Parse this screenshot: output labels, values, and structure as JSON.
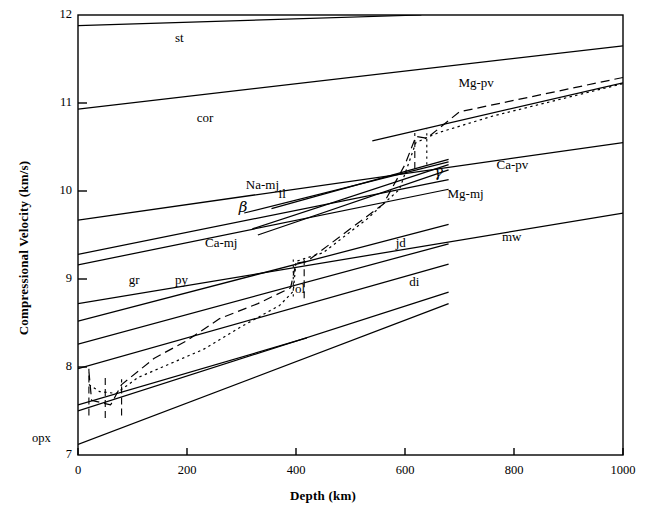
{
  "figure": {
    "kind": "scientific-line-plot",
    "background": "#ffffff",
    "line_color": "#000000"
  },
  "axes": {
    "x_title": "Depth (km)",
    "y_title": "Compressional Velocity (km/s)",
    "x_ticks": [
      "0",
      "200",
      "400",
      "600",
      "800",
      "1000"
    ],
    "y_ticks": [
      "7",
      "8",
      "9",
      "10",
      "11",
      "12"
    ],
    "extra_y_label": "opx"
  },
  "chart_data": {
    "type": "line",
    "title": "",
    "xlabel": "Depth (km)",
    "ylabel": "Compressional Velocity (km/s)",
    "xlim": [
      0,
      1000
    ],
    "ylim": [
      7,
      12
    ],
    "xticks": [
      0,
      200,
      400,
      600,
      800,
      1000
    ],
    "yticks": [
      7,
      8,
      9,
      10,
      11,
      12
    ],
    "grid": false,
    "legend": "inline-curve-labels",
    "x_units": "km",
    "y_units": "km/s",
    "series": [
      {
        "name": "st",
        "label": "st",
        "style": "solid",
        "points": [
          [
            0,
            11.88
          ],
          [
            630,
            12.0
          ]
        ],
        "label_pos": [
          200,
          11.73
        ]
      },
      {
        "name": "cor",
        "label": "cor",
        "style": "solid",
        "points": [
          [
            0,
            10.93
          ],
          [
            1000,
            11.65
          ]
        ],
        "label_pos": [
          240,
          10.82
        ]
      },
      {
        "name": "Mg-pv",
        "label": "Mg-pv",
        "style": "solid",
        "points": [
          [
            540,
            10.57
          ],
          [
            1000,
            11.23
          ]
        ],
        "label_pos": [
          720,
          11.22
        ]
      },
      {
        "name": "Ca-pv",
        "label": "Ca-pv",
        "style": "solid",
        "points": [
          [
            0,
            9.67
          ],
          [
            1000,
            10.55
          ]
        ],
        "label_pos": [
          790,
          10.28
        ]
      },
      {
        "name": "mw",
        "label": "mw",
        "style": "solid",
        "points": [
          [
            0,
            8.72
          ],
          [
            1000,
            9.75
          ]
        ],
        "label_pos": [
          800,
          9.47
        ]
      },
      {
        "name": "Na-mj",
        "label": "Na-mj",
        "style": "solid",
        "points": [
          [
            305,
            9.75
          ],
          [
            680,
            10.33
          ]
        ],
        "label_pos": [
          330,
          10.06
        ]
      },
      {
        "name": "il",
        "label": "il",
        "style": "solid",
        "points": [
          [
            355,
            9.8
          ],
          [
            680,
            10.36
          ]
        ],
        "label_pos": [
          390,
          9.96
        ]
      },
      {
        "name": "beta",
        "label": "β",
        "style": "solid",
        "points": [
          [
            320,
            9.57
          ],
          [
            680,
            10.3
          ]
        ],
        "label_pos": [
          317,
          9.82
        ]
      },
      {
        "name": "gamma",
        "label": "γ",
        "style": "solid",
        "points": [
          [
            330,
            9.5
          ],
          [
            680,
            10.24
          ]
        ],
        "label_pos": [
          675,
          10.22
        ]
      },
      {
        "name": "Ca-mj",
        "label": "Ca-mj",
        "style": "solid",
        "points": [
          [
            0,
            9.28
          ],
          [
            680,
            10.13
          ]
        ],
        "label_pos": [
          255,
          9.4
        ]
      },
      {
        "name": "Mg-mj",
        "label": "Mg-mj",
        "style": "solid",
        "points": [
          [
            0,
            9.16
          ],
          [
            680,
            10.02
          ]
        ],
        "label_pos": [
          700,
          9.95
        ]
      },
      {
        "name": "gr",
        "label": "gr",
        "style": "solid",
        "points": [
          [
            0,
            8.52
          ],
          [
            680,
            9.62
          ]
        ],
        "label_pos": [
          115,
          8.98
        ]
      },
      {
        "name": "py",
        "label": "py",
        "style": "solid",
        "points": [
          [
            0,
            8.26
          ],
          [
            680,
            9.4
          ]
        ],
        "label_pos": [
          200,
          8.98
        ]
      },
      {
        "name": "jd",
        "label": "jd",
        "style": "solid",
        "points": [
          [
            0,
            7.98
          ],
          [
            680,
            9.17
          ]
        ],
        "label_pos": [
          605,
          9.4
        ]
      },
      {
        "name": "ol",
        "label": "ol",
        "style": "solid",
        "points": [
          [
            0,
            7.57
          ],
          [
            420,
            8.33
          ]
        ],
        "label_pos": [
          420,
          8.87
        ]
      },
      {
        "name": "di",
        "label": "di",
        "style": "solid",
        "points": [
          [
            0,
            7.5
          ],
          [
            680,
            8.85
          ]
        ],
        "label_pos": [
          630,
          8.95
        ]
      },
      {
        "name": "opx",
        "label": "opx",
        "style": "solid",
        "points": [
          [
            0,
            7.12
          ],
          [
            680,
            8.72
          ]
        ],
        "label_pos": [
          -40,
          7.18
        ]
      },
      {
        "name": "model-dashed",
        "label": "",
        "style": "dashed",
        "points": [
          [
            20,
            7.95
          ],
          [
            25,
            7.62
          ],
          [
            60,
            7.57
          ],
          [
            80,
            7.8
          ],
          [
            140,
            8.1
          ],
          [
            200,
            8.3
          ],
          [
            260,
            8.55
          ],
          [
            330,
            8.72
          ],
          [
            390,
            8.9
          ],
          [
            400,
            9.18
          ],
          [
            420,
            9.2
          ],
          [
            560,
            9.85
          ],
          [
            600,
            10.3
          ],
          [
            620,
            10.62
          ],
          [
            640,
            10.6
          ],
          [
            700,
            10.9
          ],
          [
            1000,
            11.29
          ]
        ]
      },
      {
        "name": "model-dotted",
        "label": "",
        "style": "dotted",
        "points": [
          [
            20,
            7.8
          ],
          [
            40,
            7.72
          ],
          [
            70,
            7.7
          ],
          [
            110,
            7.88
          ],
          [
            170,
            8.04
          ],
          [
            230,
            8.2
          ],
          [
            300,
            8.46
          ],
          [
            370,
            8.7
          ],
          [
            395,
            8.86
          ],
          [
            400,
            9.2
          ],
          [
            450,
            9.3
          ],
          [
            530,
            9.68
          ],
          [
            590,
            10.02
          ],
          [
            620,
            10.55
          ],
          [
            660,
            10.66
          ],
          [
            760,
            10.85
          ],
          [
            1000,
            11.22
          ]
        ]
      }
    ],
    "phase_labels": [
      "st",
      "cor",
      "Mg-pv",
      "Ca-pv",
      "mw",
      "Na-mj",
      "il",
      "β",
      "γ",
      "Ca-mj",
      "Mg-mj",
      "gr",
      "py",
      "jd",
      "ol",
      "di",
      "opx"
    ]
  }
}
